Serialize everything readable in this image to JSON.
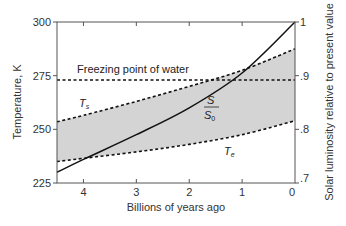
{
  "chart_data": {
    "type": "line",
    "title": "",
    "xlabel": "Billions of years ago",
    "ylabel": "Temperature, K",
    "y2label": "Solar luminosity relative to present value",
    "xlim": [
      4.5,
      0
    ],
    "ylim": [
      225,
      300
    ],
    "y2lim": [
      0.7,
      1.0
    ],
    "x_ticks": [
      4,
      3,
      2,
      1,
      0
    ],
    "x_tick_labels": [
      "4",
      "3",
      "2",
      "1",
      "0"
    ],
    "y_ticks": [
      225,
      250,
      275,
      300
    ],
    "y_tick_labels": [
      "225",
      "250",
      "275",
      "300"
    ],
    "y2_ticks": [
      0.7,
      0.8,
      0.9,
      1.0
    ],
    "y2_tick_labels": [
      ".7",
      ".8",
      ".9",
      "1"
    ],
    "grid": false,
    "legend": null,
    "series": [
      {
        "name": "Ts",
        "label": "T_s",
        "style": "dashed",
        "axis": "left",
        "x": [
          4.5,
          4,
          3,
          2,
          1,
          0
        ],
        "values": [
          253.5,
          256.5,
          263,
          270,
          277.5,
          287.5
        ]
      },
      {
        "name": "Te",
        "label": "T_e",
        "style": "dashed",
        "axis": "left",
        "x": [
          4.5,
          4,
          3,
          2,
          1,
          0
        ],
        "values": [
          235,
          236.5,
          239.5,
          243,
          247.5,
          254
        ]
      },
      {
        "name": "S/S0",
        "label": "S/S0",
        "style": "solid",
        "axis": "right",
        "x": [
          4.5,
          4,
          3,
          2,
          1,
          0
        ],
        "values": [
          0.72,
          0.744,
          0.79,
          0.84,
          0.905,
          1.0
        ]
      },
      {
        "name": "Freezing point of water",
        "label": "Freezing point of water",
        "style": "dashed",
        "axis": "left",
        "x": [
          4.5,
          0
        ],
        "values": [
          273,
          273
        ]
      }
    ],
    "shaded_region": {
      "between": [
        "Te",
        "Ts"
      ],
      "color": "#d4d4d4"
    },
    "annotations": [
      {
        "text": "Freezing point of water",
        "x": 4.15,
        "y": 276
      },
      {
        "text": "T_s",
        "x": 3.95,
        "y": 262
      },
      {
        "text": "T_e",
        "x": 1.2,
        "y": 241
      },
      {
        "text": "S/S0",
        "x": 1.6,
        "y": 263
      }
    ]
  },
  "labels": {
    "freezing": "Freezing point of water",
    "ts_main": "T",
    "ts_sub": "s",
    "te_main": "T",
    "te_sub": "e",
    "s_num": "S",
    "s_den": "S",
    "s_den_sub": "0"
  },
  "colors": {
    "line": "#111111",
    "shade": "#d4d4d4",
    "axis": "#555555"
  }
}
